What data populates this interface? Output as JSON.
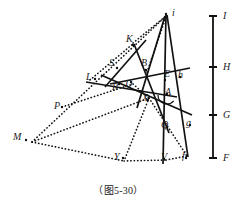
{
  "figure": {
    "caption": "（图5-30）",
    "background_color": "#ffffff",
    "stroke_color": "#111111",
    "width": 237,
    "height": 209
  },
  "scale_bar": {
    "name": "vertical-measure-bar",
    "x": 213,
    "top": 16,
    "bottom": 158,
    "tick_half_width": 4,
    "ticks": [
      {
        "label": "I",
        "y": 16
      },
      {
        "label": "H",
        "y": 67
      },
      {
        "label": "G",
        "y": 115
      },
      {
        "label": "F",
        "y": 158
      }
    ]
  },
  "points": [
    {
      "label": "i",
      "x": 172,
      "y": 8,
      "px": 166,
      "py": 14
    },
    {
      "label": "K",
      "x": 126,
      "y": 34,
      "px": 133,
      "py": 45
    },
    {
      "label": "S",
      "x": 109,
      "y": 58,
      "px": 117,
      "py": 68
    },
    {
      "label": "B",
      "x": 141,
      "y": 58,
      "px": 146,
      "py": 70
    },
    {
      "label": "E",
      "x": 164,
      "y": 69,
      "px": 165,
      "py": 80
    },
    {
      "label": "h",
      "x": 178,
      "y": 70,
      "px": 180,
      "py": 77
    },
    {
      "label": "L",
      "x": 86,
      "y": 72,
      "px": 95,
      "py": 79
    },
    {
      "label": "D",
      "x": 125,
      "y": 79,
      "px": 131,
      "py": 82
    },
    {
      "label": "R",
      "x": 112,
      "y": 82,
      "px": 119,
      "py": 84
    },
    {
      "label": "A",
      "x": 165,
      "y": 87,
      "px": 167,
      "py": 94
    },
    {
      "label": "X",
      "x": 142,
      "y": 93,
      "px": 148,
      "py": 100
    },
    {
      "label": "P",
      "x": 54,
      "y": 101,
      "px": 62,
      "py": 107
    },
    {
      "label": "Q",
      "x": 161,
      "y": 120,
      "px": 167,
      "py": 127
    },
    {
      "label": "g",
      "x": 186,
      "y": 118,
      "px": 190,
      "py": 125
    },
    {
      "label": "M",
      "x": 13,
      "y": 132,
      "px": 26,
      "py": 140
    },
    {
      "label": "Y",
      "x": 114,
      "y": 152,
      "px": 123,
      "py": 158
    },
    {
      "label": "V",
      "x": 161,
      "y": 152,
      "px": 164,
      "py": 159
    },
    {
      "label": "f",
      "x": 182,
      "y": 151,
      "px": 186,
      "py": 158
    }
  ],
  "solid_lines": [
    {
      "name": "line-i-to-V",
      "x1": 166,
      "y1": 14,
      "x2": 163,
      "y2": 164
    },
    {
      "name": "line-i-to-f",
      "x1": 167,
      "y1": 15,
      "x2": 188,
      "y2": 157
    },
    {
      "name": "line-i-to-X",
      "x1": 165,
      "y1": 16,
      "x2": 137,
      "y2": 108
    },
    {
      "name": "line-K-to-Q",
      "x1": 134,
      "y1": 44,
      "x2": 169,
      "y2": 133
    },
    {
      "name": "line-h-long",
      "x1": 110,
      "y1": 84,
      "x2": 190,
      "y2": 68
    },
    {
      "name": "line-L-to-A",
      "x1": 86,
      "y1": 82,
      "x2": 177,
      "y2": 97
    },
    {
      "name": "line-S-to-g",
      "x1": 101,
      "y1": 75,
      "x2": 192,
      "y2": 115
    },
    {
      "name": "line-D-upper",
      "x1": 146,
      "y1": 40,
      "x2": 105,
      "y2": 87
    }
  ],
  "dotted_lines": [
    {
      "name": "dotted-M-to-i",
      "x1": 32,
      "y1": 142,
      "x2": 166,
      "y2": 16
    },
    {
      "name": "dotted-M-to-X",
      "x1": 32,
      "y1": 142,
      "x2": 149,
      "y2": 98
    },
    {
      "name": "dotted-M-to-Y",
      "x1": 32,
      "y1": 142,
      "x2": 124,
      "y2": 161
    },
    {
      "name": "dotted-X-to-Y",
      "x1": 149,
      "y1": 98,
      "x2": 124,
      "y2": 161
    },
    {
      "name": "dotted-Y-to-V",
      "x1": 124,
      "y1": 161,
      "x2": 166,
      "y2": 160
    },
    {
      "name": "dotted-V-to-f",
      "x1": 166,
      "y1": 160,
      "x2": 187,
      "y2": 156
    },
    {
      "name": "dotted-X-to-f",
      "x1": 149,
      "y1": 98,
      "x2": 187,
      "y2": 156
    },
    {
      "name": "dotted-K-to-i",
      "x1": 133,
      "y1": 43,
      "x2": 166,
      "y2": 16
    },
    {
      "name": "dotted-B-to-i",
      "x1": 147,
      "y1": 72,
      "x2": 166,
      "y2": 17
    },
    {
      "name": "dotted-L-to-K",
      "x1": 90,
      "y1": 80,
      "x2": 134,
      "y2": 43
    },
    {
      "name": "dotted-P-to-D",
      "x1": 62,
      "y1": 107,
      "x2": 133,
      "y2": 84
    },
    {
      "name": "dotted-D-to-X",
      "x1": 133,
      "y1": 84,
      "x2": 150,
      "y2": 99
    }
  ],
  "angle_arc": {
    "name": "angle-arc-at-A",
    "cx": 167,
    "cy": 96,
    "r": 9
  }
}
